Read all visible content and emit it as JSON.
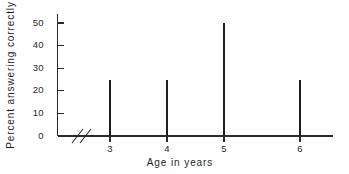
{
  "chart_data": {
    "type": "bar",
    "title": "",
    "subtitle": "",
    "xlabel": "Age in years",
    "ylabel": "Percent answering correctly",
    "categories": [
      "3",
      "4",
      "5",
      "6"
    ],
    "values": [
      25,
      25,
      50,
      25
    ],
    "series": [
      {
        "name": "Percent answering correctly",
        "values": [
          25,
          25,
          50,
          25
        ]
      }
    ],
    "ylim": [
      0,
      50
    ],
    "yticks": [
      "0",
      "10",
      "20",
      "30",
      "40",
      "50"
    ],
    "ytick_values": [
      0,
      10,
      20,
      30,
      40,
      50
    ],
    "xticks": [
      "3",
      "4",
      "5",
      "6"
    ],
    "xtick_values": [
      3,
      4,
      5,
      6
    ],
    "grid": false,
    "legend": false,
    "legend_position": "none",
    "annotations": [
      {
        "name": "x-axis-break",
        "symbol": "//",
        "description": "axis break between 0 and 3"
      }
    ],
    "bar_style": "thin-spike",
    "colors": {
      "bar": "#1e1e1e",
      "axis": "#2b2b2b",
      "text": "#1f1f1f",
      "background": "#ffffff"
    }
  }
}
